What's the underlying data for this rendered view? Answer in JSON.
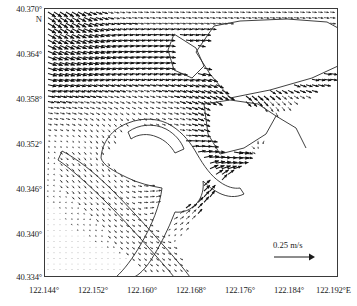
{
  "figure": {
    "type": "vector-field-map",
    "north_indicator": "N",
    "east_indicator": "E"
  },
  "scale": {
    "label": "0.25 m/s",
    "value": 0.25,
    "units": "m/s",
    "arrow_icon": "right-arrow-icon"
  },
  "chart_data": {
    "type": "scatter",
    "subtype": "quiver-vector-field",
    "title": "",
    "xlabel": "",
    "ylabel": "",
    "xlim": [
      122.144,
      122.192
    ],
    "ylim": [
      40.334,
      40.37
    ],
    "grid": false,
    "legend_position": "bottom-right",
    "x_tick_labels": [
      "122.144°",
      "122.152°",
      "122.160°",
      "122.168°",
      "122.176°",
      "122.184°",
      "122.192°E"
    ],
    "x_tick_values": [
      122.144,
      122.152,
      122.16,
      122.168,
      122.176,
      122.184,
      122.192
    ],
    "y_tick_labels": [
      "40.334°",
      "40.340°",
      "40.346°",
      "40.352°",
      "40.358°",
      "40.364°",
      "40.370°"
    ],
    "y_tick_values": [
      40.334,
      40.34,
      40.346,
      40.352,
      40.358,
      40.364,
      40.37
    ],
    "x_tick_step": 0.008,
    "y_tick_step": 0.006,
    "vector_scale_reference": 0.25,
    "vector_scale_units": "m/s",
    "annotations": [
      "N",
      "E",
      "0.25 m/s"
    ]
  },
  "axes": {
    "y_labels": [
      "40.370°",
      "40.364°",
      "40.358°",
      "40.352°",
      "40.346°",
      "40.340°",
      "40.334°"
    ],
    "x_labels": [
      "122.144°",
      "122.152°",
      "122.160°",
      "122.168°",
      "122.176°",
      "122.184°",
      "122.192°E"
    ],
    "north_label": "N"
  }
}
